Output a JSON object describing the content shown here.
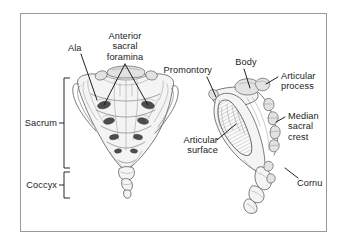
{
  "figure": {
    "frame_color": "#9a9a9e",
    "background_color": "#ffffff",
    "ink_color": "#1b1b1b",
    "drawing_line_color": "#4a4a4a"
  },
  "labels": {
    "ala": "Ala",
    "anterior_sacral_foramina_line1": "Anterior",
    "anterior_sacral_foramina_line2": "sacral",
    "anterior_sacral_foramina_line3": "foramina",
    "sacrum": "Sacrum",
    "coccyx": "Coccyx",
    "promontory": "Promontory",
    "body": "Body",
    "articular_process_line1": "Articular",
    "articular_process_line2": "process",
    "median_sacral_crest_line1": "Median",
    "median_sacral_crest_line2": "sacral",
    "median_sacral_crest_line3": "crest",
    "cornu": "Cornu",
    "articular_surface_line1": "Articular",
    "articular_surface_line2": "surface"
  },
  "views": {
    "anterior": {
      "name": "anterior-sacrum-view",
      "description": "Anterior (pelvic) surface of sacrum and coccyx",
      "foramina_pairs": 4
    },
    "lateral": {
      "name": "lateral-sacrum-view",
      "description": "Lateral view of sacrum and coccyx"
    }
  },
  "brackets": {
    "sacrum": {
      "top": 78,
      "bottom": 168
    },
    "coccyx": {
      "top": 172,
      "bottom": 198
    }
  }
}
